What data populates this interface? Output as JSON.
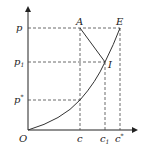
{
  "diagram": {
    "type": "equilibrium line diagram (p vs c)",
    "axes": {
      "origin_label": "O",
      "y_ticks": [
        {
          "id": "p",
          "text": "p",
          "sub": ""
        },
        {
          "id": "p1",
          "text": "p",
          "sub": "1"
        },
        {
          "id": "pstar",
          "text": "p",
          "sub": "*"
        }
      ],
      "x_ticks": [
        {
          "id": "c",
          "text": "c",
          "sub": ""
        },
        {
          "id": "c1",
          "text": "c",
          "sub": "1"
        },
        {
          "id": "cstar",
          "text": "c",
          "sub": "*"
        }
      ]
    },
    "points": [
      {
        "id": "A",
        "label": "A",
        "x": "c",
        "y": "p"
      },
      {
        "id": "E",
        "label": "E",
        "x": "c*",
        "y": "p"
      },
      {
        "id": "I",
        "label": "I",
        "x": "c1",
        "y": "p1"
      }
    ],
    "curve": {
      "name": "equilibrium curve",
      "from": "O",
      "through": [
        "(c, p*)",
        "I"
      ],
      "to": "E"
    },
    "segments": [
      {
        "from": "A",
        "to": "I"
      }
    ]
  }
}
